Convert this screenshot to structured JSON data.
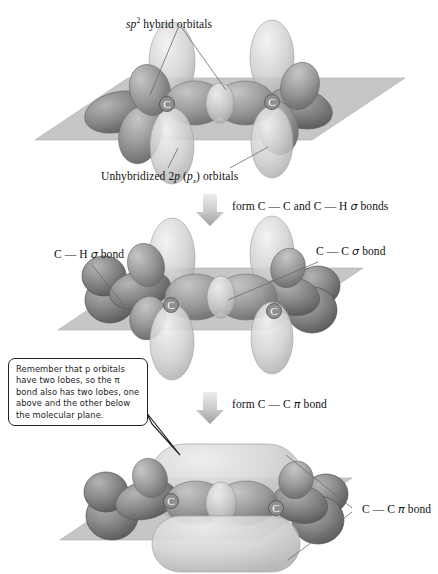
{
  "figure": {
    "type": "chemistry-orbital-diagram",
    "panels": 3
  },
  "colors": {
    "plane": "#c6c6c6",
    "plane_edge": "#a8a8a8",
    "sp2_lobe_dark": "#8b8b8b",
    "sp2_lobe_shadow": "#5f5f5f",
    "p_orbital_light": "#c3c3c3",
    "pi_cloud": "#cfcfcf",
    "arrow": "#b3b3b3",
    "leader_line": "#6a6a6a",
    "text": "#111111",
    "callout_border": "#222222",
    "atom_label": "#ffffff"
  },
  "panel1": {
    "name": "sp2-hybridized carbons with unhybridized p orbitals",
    "top_label": {
      "prefix": "sp",
      "superscript": "2",
      "rest": " hybrid orbitals"
    },
    "bottom_label": {
      "pre": "Unhybridized 2",
      "ital1": "p",
      "mid": " (",
      "ital2": "p",
      "sub": "z",
      "post": ")  orbitals"
    },
    "atoms": [
      "C",
      "C"
    ]
  },
  "arrow1": {
    "label_pre": "form C ",
    "dash1": "—",
    "mid": " C and C ",
    "dash2": "—",
    "greek": "σ",
    "post": " bonds",
    "full": "form C — C and C — H σ bonds",
    "direction": "down"
  },
  "panel2": {
    "name": "sigma-bonded framework",
    "left_label": {
      "text": "C — H ",
      "greek": "σ",
      "post": " bond"
    },
    "right_label": {
      "text": "C — C ",
      "greek": "σ",
      "post": " bond"
    },
    "atoms": [
      "C",
      "C"
    ]
  },
  "callout": {
    "lines": [
      "Remember that p orbitals",
      "have two lobes, so the π",
      "bond also has two lobes, one",
      "above and the other below",
      "the molecular plane."
    ],
    "full_text": "Remember that p orbitals have two lobes, so the π bond also has two lobes, one above and the other below the molecular plane."
  },
  "arrow2": {
    "full": "form C — C π bond",
    "pre": "form C ",
    "dash": "—",
    "mid": " C ",
    "greek": "π",
    "post": " bond",
    "direction": "down"
  },
  "panel3": {
    "name": "pi bond formed above and below the molecular plane",
    "right_label": {
      "pre": "C — C ",
      "greek": "π",
      "post": " bond"
    },
    "atoms": [
      "C",
      "C"
    ]
  }
}
